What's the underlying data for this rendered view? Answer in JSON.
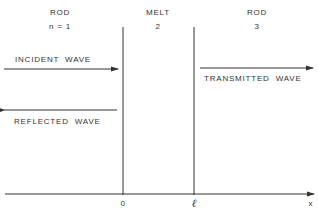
{
  "regions": [
    {
      "name": "ROD",
      "index": "n = 1"
    },
    {
      "name": "MELT",
      "index": "2"
    },
    {
      "name": "ROD",
      "index": "3"
    }
  ],
  "waves": {
    "incident": "INCIDENT  WAVE",
    "reflected": "REFLECTED  WAVE",
    "transmitted": "TRANSMITTED  WAVE"
  },
  "axis": {
    "origin_label": "0",
    "boundary_label": "ℓ",
    "axis_label": "x"
  },
  "colors": {
    "line": "#333333",
    "background": "#ffffff"
  }
}
